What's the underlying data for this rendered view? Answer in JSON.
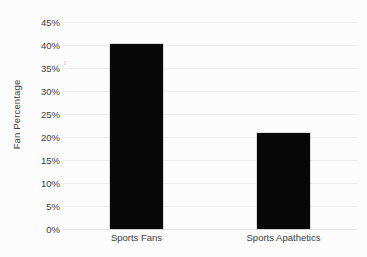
{
  "chart_data": {
    "type": "bar",
    "title": "",
    "xlabel": "",
    "ylabel": "Fan Percentage",
    "categories": [
      "Sports Fans",
      "Sports Apathetics"
    ],
    "values": [
      40.2,
      20.9
    ],
    "value_labels": [
      "40%",
      "21%"
    ],
    "ylim": [
      0,
      45
    ],
    "ytick_values": [
      45,
      40,
      35,
      30,
      25,
      20,
      15,
      10,
      5,
      0
    ],
    "ytick_labels": [
      "45%",
      "40%",
      "35%",
      "30%",
      "25%",
      "20%",
      "15%",
      "10%",
      "5%",
      "0%"
    ],
    "grid": true,
    "legend": "none",
    "bar_color": "#080808",
    "gridline_color": "#eeeeee",
    "background_color": "#fcfcfc",
    "axis_text_color": "#3d3d3d"
  },
  "artifact": {
    "speck_glyph": "r"
  }
}
